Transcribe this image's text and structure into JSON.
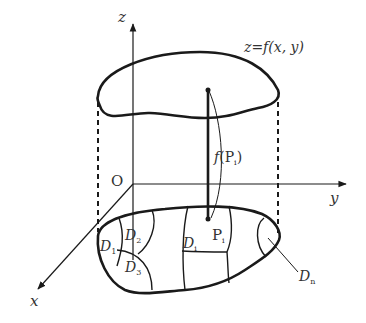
{
  "diagram": {
    "axes": {
      "z_label": "z",
      "y_label": "y",
      "x_label": "x",
      "origin_label": "O"
    },
    "surface_label": "z=f(x, y)",
    "height_label": "f(P",
    "height_label_sub": "i",
    "height_label_close": ")",
    "point_label": "P",
    "point_label_sub": "i",
    "subregions": {
      "d1": {
        "main": "D",
        "sub": "1"
      },
      "d2": {
        "main": "D",
        "sub": "2"
      },
      "d3": {
        "main": "D",
        "sub": "3"
      },
      "di": {
        "main": "D",
        "sub": "i"
      },
      "dn": {
        "main": "D",
        "sub": "n"
      }
    },
    "colors": {
      "line": "#1a1a1a",
      "text": "#333333",
      "background": "#ffffff"
    }
  }
}
